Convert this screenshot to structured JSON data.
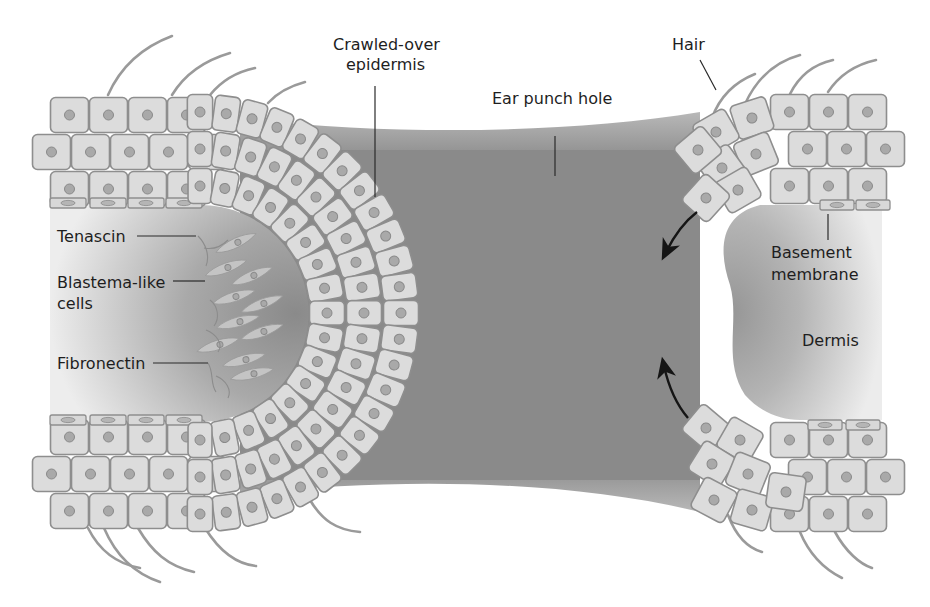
{
  "figure": {
    "labels": {
      "crawled_over_epidermis_line1": "Crawled-over",
      "crawled_over_epidermis_line2": "epidermis",
      "ear_punch_hole": "Ear punch hole",
      "hair": "Hair",
      "tenascin": "Tenascin",
      "blastema_line1": "Blastema-like",
      "blastema_line2": "cells",
      "fibronectin": "Fibronectin",
      "basement_line1": "Basement",
      "basement_line2": "membrane",
      "dermis": "Dermis"
    },
    "colors": {
      "background": "#ffffff",
      "hole_fill": "#8a8a8a",
      "cell_fill": "#dcdcdc",
      "cell_border": "#8e8e8e",
      "dermis_light": "#e6e6e6",
      "dermis_dark": "#8f8f8f",
      "text": "#1e1e1e",
      "arrow": "#151515"
    },
    "regions": [
      "left epidermis (crawled-over, wrapped around wound edge)",
      "ear punch hole (center)",
      "right epidermis (migrating)",
      "left dermis with blastema-like cells",
      "right dermis"
    ],
    "arrows": [
      {
        "name": "upper migration arrow",
        "direction": "down-left"
      },
      {
        "name": "lower migration arrow",
        "direction": "up-left"
      }
    ]
  }
}
